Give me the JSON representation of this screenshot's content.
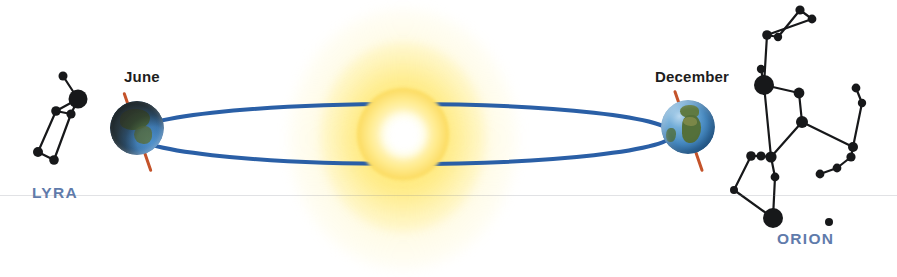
{
  "scene": {
    "title": "Earth's orbit around the Sun with seasonal night-sky constellations",
    "background_color": "#ffffff",
    "width": 897,
    "height": 277
  },
  "sun": {
    "name": "Sun",
    "core_color": "#ffffff",
    "disc_color": "#ffeb8e",
    "glow_color": "#ffe478",
    "center_x": 403,
    "center_y": 134
  },
  "orbit": {
    "name": "Earth orbit ellipse",
    "color": "#2a5fa6",
    "stroke_width": 4,
    "center_x": 403,
    "center_y": 134,
    "radius_x": 270,
    "radius_y": 30
  },
  "earths": [
    {
      "id": "june",
      "label": "June",
      "axis_color": "#c4532a",
      "axis_tilt_deg": -19,
      "lighting": "night-side facing viewer",
      "center_x": 137,
      "center_y": 128
    },
    {
      "id": "december",
      "label": "December",
      "axis_color": "#c4532a",
      "axis_tilt_deg": -19,
      "lighting": "day-side facing viewer",
      "center_x": 688,
      "center_y": 127
    }
  ],
  "constellations": [
    {
      "id": "lyra",
      "label": "LYRA",
      "label_color": "#5f7bab",
      "star_color": "#17181a",
      "brightest_star_radius": 9.5,
      "stars": [
        {
          "x": 63,
          "y": 76,
          "r": 4.5
        },
        {
          "x": 78,
          "y": 99,
          "r": 9.5
        },
        {
          "x": 56,
          "y": 111,
          "r": 4.8
        },
        {
          "x": 71,
          "y": 114,
          "r": 4.6
        },
        {
          "x": 38,
          "y": 152,
          "r": 5.0
        },
        {
          "x": 54,
          "y": 160,
          "r": 4.8
        }
      ],
      "lines": [
        [
          0,
          1
        ],
        [
          1,
          3
        ],
        [
          1,
          2
        ],
        [
          2,
          4
        ],
        [
          4,
          5
        ],
        [
          5,
          3
        ],
        [
          2,
          3
        ]
      ]
    },
    {
      "id": "orion",
      "label": "ORION",
      "label_color": "#5f7bab",
      "star_color": "#17181a",
      "brightest_star_radius": 10,
      "stars": [
        {
          "x": 800,
          "y": 10,
          "r": 4.6
        },
        {
          "x": 812,
          "y": 19,
          "r": 4.4
        },
        {
          "x": 767,
          "y": 35,
          "r": 4.8
        },
        {
          "x": 778,
          "y": 37,
          "r": 4.2
        },
        {
          "x": 761,
          "y": 69,
          "r": 4.2
        },
        {
          "x": 764,
          "y": 85,
          "r": 10.0
        },
        {
          "x": 799,
          "y": 93,
          "r": 5.4
        },
        {
          "x": 802,
          "y": 122,
          "r": 6.0
        },
        {
          "x": 751,
          "y": 156,
          "r": 4.8
        },
        {
          "x": 761,
          "y": 156,
          "r": 4.6
        },
        {
          "x": 771,
          "y": 157,
          "r": 5.6
        },
        {
          "x": 775,
          "y": 177,
          "r": 4.4
        },
        {
          "x": 773,
          "y": 218,
          "r": 10.0
        },
        {
          "x": 856,
          "y": 88,
          "r": 4.4
        },
        {
          "x": 862,
          "y": 103,
          "r": 4.2
        },
        {
          "x": 853,
          "y": 147,
          "r": 5.0
        },
        {
          "x": 851,
          "y": 157,
          "r": 4.6
        },
        {
          "x": 837,
          "y": 168,
          "r": 4.4
        },
        {
          "x": 820,
          "y": 174,
          "r": 4.4
        },
        {
          "x": 829,
          "y": 222,
          "r": 4.0
        },
        {
          "x": 734,
          "y": 190,
          "r": 4.0
        }
      ],
      "lines": [
        [
          0,
          1
        ],
        [
          0,
          3
        ],
        [
          1,
          2
        ],
        [
          2,
          3
        ],
        [
          2,
          5
        ],
        [
          4,
          5
        ],
        [
          5,
          6
        ],
        [
          6,
          7
        ],
        [
          5,
          10
        ],
        [
          7,
          10
        ],
        [
          7,
          15
        ],
        [
          8,
          9
        ],
        [
          9,
          10
        ],
        [
          10,
          11
        ],
        [
          11,
          12
        ],
        [
          13,
          14
        ],
        [
          14,
          15
        ],
        [
          15,
          16
        ],
        [
          16,
          17
        ],
        [
          17,
          18
        ],
        [
          8,
          20
        ],
        [
          20,
          12
        ]
      ]
    }
  ],
  "decor": {
    "scan_seam_y": 195,
    "scan_seam_color": "rgba(120,125,135,0.22)"
  }
}
